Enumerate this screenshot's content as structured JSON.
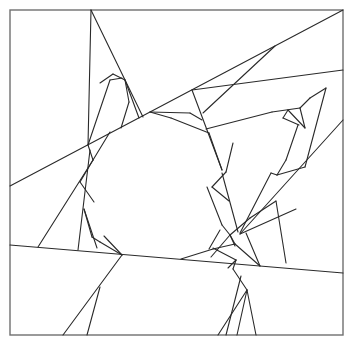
{
  "figure": {
    "canvas": {
      "width": 353,
      "height": 345
    },
    "colors": {
      "background": "#ffffff",
      "frame": "#707070",
      "lines": "#2a2a2a"
    },
    "frame": {
      "x": 10,
      "y": 10,
      "width": 333,
      "height": 325
    },
    "lines": [
      [
        10,
        186,
        343,
        10
      ],
      [
        10,
        245,
        343,
        273
      ],
      [
        192,
        90,
        343,
        70
      ],
      [
        240,
        234,
        343,
        120
      ],
      [
        91,
        10,
        143,
        117
      ],
      [
        91,
        10,
        88,
        145
      ],
      [
        88,
        145,
        110,
        80
      ],
      [
        110,
        80,
        122,
        78
      ],
      [
        100,
        83,
        113,
        74
      ],
      [
        113,
        74,
        125,
        80
      ],
      [
        125,
        80,
        129,
        102
      ],
      [
        129,
        102,
        121,
        128
      ],
      [
        125,
        80,
        139,
        118
      ],
      [
        88,
        145,
        93,
        160
      ],
      [
        93,
        160,
        80,
        182
      ],
      [
        80,
        182,
        94,
        202
      ],
      [
        110,
        132,
        93,
        160
      ],
      [
        93,
        160,
        38,
        247
      ],
      [
        90,
        150,
        78,
        250
      ],
      [
        84,
        209,
        97,
        248
      ],
      [
        84,
        209,
        92,
        237
      ],
      [
        92,
        237,
        100,
        242
      ],
      [
        100,
        242,
        122,
        255
      ],
      [
        122,
        255,
        104,
        236
      ],
      [
        122,
        255,
        63,
        335
      ],
      [
        100,
        287,
        87,
        335
      ],
      [
        150,
        112,
        190,
        113
      ],
      [
        190,
        113,
        202,
        120
      ],
      [
        192,
        90,
        222,
        170
      ],
      [
        222,
        170,
        209,
        133
      ],
      [
        209,
        133,
        171,
        118
      ],
      [
        171,
        118,
        150,
        112
      ],
      [
        203,
        113,
        275,
        46
      ],
      [
        206,
        129,
        272,
        112
      ],
      [
        272,
        112,
        300,
        108
      ],
      [
        300,
        108,
        305,
        128
      ],
      [
        300,
        108,
        310,
        98
      ],
      [
        305,
        128,
        288,
        110
      ],
      [
        288,
        110,
        283,
        118
      ],
      [
        283,
        118,
        299,
        125
      ],
      [
        310,
        98,
        326,
        88
      ],
      [
        298,
        125,
        286,
        160
      ],
      [
        286,
        160,
        277,
        175
      ],
      [
        277,
        175,
        271,
        173
      ],
      [
        271,
        173,
        240,
        233
      ],
      [
        326,
        88,
        305,
        167
      ],
      [
        305,
        167,
        277,
        175
      ],
      [
        233,
        143,
        226,
        172
      ],
      [
        226,
        172,
        212,
        187
      ],
      [
        222,
        173,
        238,
        232
      ],
      [
        207,
        187,
        222,
        225
      ],
      [
        222,
        225,
        230,
        235
      ],
      [
        230,
        235,
        250,
        218
      ],
      [
        230,
        235,
        211,
        257
      ],
      [
        230,
        235,
        235,
        244
      ],
      [
        212,
        187,
        229,
        201
      ],
      [
        220,
        230,
        209,
        249
      ],
      [
        235,
        244,
        213,
        249
      ],
      [
        213,
        249,
        181,
        259
      ],
      [
        236,
        260,
        213,
        248
      ],
      [
        236,
        260,
        228,
        268
      ],
      [
        235,
        244,
        260,
        266
      ],
      [
        260,
        266,
        246,
        233
      ],
      [
        236,
        260,
        233,
        269
      ],
      [
        233,
        269,
        247,
        290
      ],
      [
        247,
        290,
        218,
        335
      ],
      [
        247,
        290,
        237,
        335
      ],
      [
        241,
        276,
        226,
        335
      ],
      [
        230,
        235,
        235,
        246
      ],
      [
        247,
        290,
        256,
        335
      ],
      [
        250,
        218,
        276,
        201
      ],
      [
        276,
        201,
        286,
        263
      ],
      [
        240,
        234,
        296,
        209
      ]
    ]
  }
}
